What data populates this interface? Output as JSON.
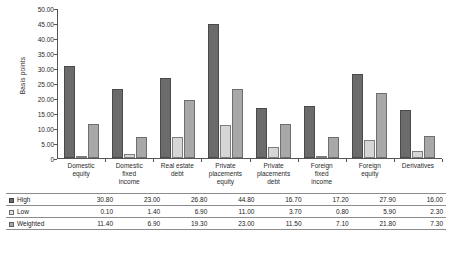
{
  "chart_data": {
    "type": "bar",
    "title": "",
    "xlabel": "",
    "ylabel": "Basis points",
    "ylim": [
      0,
      50
    ],
    "ytick_step": 5,
    "grid": false,
    "legend_position": "table-below",
    "categories": [
      "Domestic equity",
      "Domestic fixed income",
      "Real estate debt",
      "Private placements equity",
      "Private placements debt",
      "Foreign fixed income",
      "Foreign equity",
      "Derivatives"
    ],
    "category_lines": [
      [
        "Domestic",
        "equity"
      ],
      [
        "Domestic",
        "fixed",
        "income"
      ],
      [
        "Real estate",
        "debt"
      ],
      [
        "Private",
        "placements",
        "equity"
      ],
      [
        "Private",
        "placements",
        "debt"
      ],
      [
        "Foreign",
        "fixed",
        "income"
      ],
      [
        "Foreign",
        "equity"
      ],
      [
        "Derivatives"
      ]
    ],
    "ytick_labels": [
      "50.00",
      "45.00",
      "40.00",
      "35.00",
      "30.00",
      "25.00",
      "20.00",
      "15.00",
      "10.00",
      "5.00",
      "0"
    ],
    "ytick_values": [
      50,
      45,
      40,
      35,
      30,
      25,
      20,
      15,
      10,
      5,
      0
    ],
    "series": [
      {
        "name": "High",
        "color": "#6b6b6b",
        "values": [
          30.8,
          23.0,
          26.8,
          44.8,
          16.7,
          17.2,
          27.9,
          16.0
        ],
        "labels": [
          "30.80",
          "23.00",
          "26.80",
          "44.80",
          "16.70",
          "17.20",
          "27.90",
          "16.00"
        ]
      },
      {
        "name": "Low",
        "color": "#d6d6d6",
        "values": [
          0.1,
          1.4,
          6.9,
          11.0,
          3.7,
          0.8,
          5.9,
          2.3
        ],
        "labels": [
          "0.10",
          "1.40",
          "6.90",
          "11.00",
          "3.70",
          "0.80",
          "5.90",
          "2.30"
        ]
      },
      {
        "name": "Weighted",
        "color": "#a8a8a8",
        "values": [
          11.4,
          6.9,
          19.3,
          23.0,
          11.5,
          7.1,
          21.8,
          7.3
        ],
        "labels": [
          "11.40",
          "6.90",
          "19.30",
          "23.00",
          "11.50",
          "7.10",
          "21.80",
          "7.30"
        ]
      }
    ]
  },
  "table": {
    "rows": [
      {
        "series": "High",
        "swatch": "s-high",
        "values": [
          "30.80",
          "23.00",
          "26.80",
          "44.80",
          "16.70",
          "17.20",
          "27.90",
          "16.00"
        ]
      },
      {
        "series": "Low",
        "swatch": "s-low",
        "values": [
          "0.10",
          "1.40",
          "6.90",
          "11.00",
          "3.70",
          "0.80",
          "5.90",
          "2.30"
        ]
      },
      {
        "series": "Weighted",
        "swatch": "s-weighted",
        "values": [
          "11.40",
          "6.90",
          "19.30",
          "23.00",
          "11.50",
          "7.10",
          "21.80",
          "7.30"
        ]
      }
    ]
  }
}
